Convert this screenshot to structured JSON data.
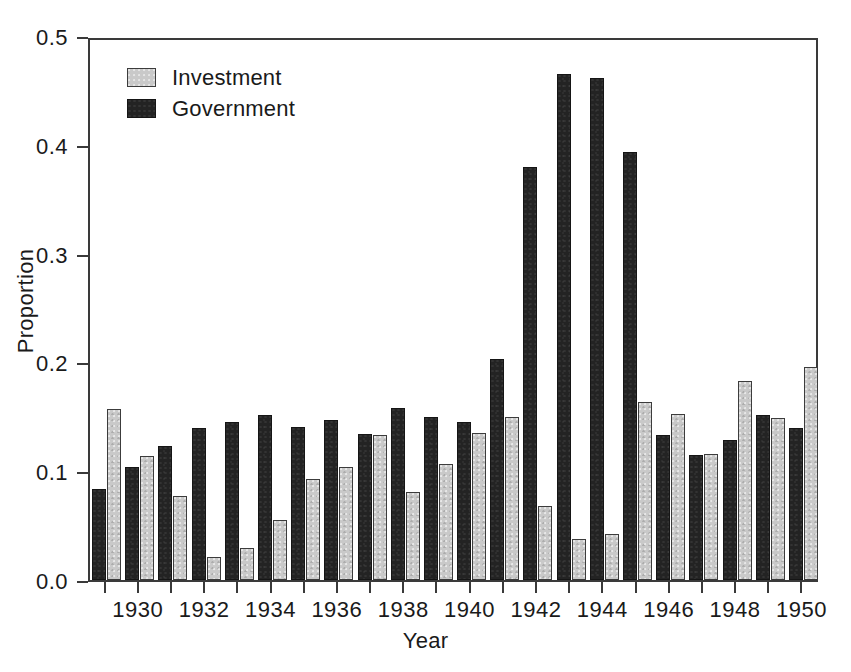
{
  "chart_data": {
    "type": "bar",
    "title": "",
    "xlabel": "Year",
    "ylabel": "Proportion",
    "ylim": [
      0.0,
      0.5
    ],
    "ytick_labels": [
      "0.0",
      "0.1",
      "0.2",
      "0.3",
      "0.4",
      "0.5"
    ],
    "ytick_values": [
      0.0,
      0.1,
      0.2,
      0.3,
      0.4,
      0.5
    ],
    "grid": false,
    "legend_position": "top-left",
    "categories": [
      1929,
      1930,
      1931,
      1932,
      1933,
      1934,
      1935,
      1936,
      1937,
      1938,
      1939,
      1940,
      1941,
      1942,
      1943,
      1944,
      1945,
      1946,
      1947,
      1948,
      1949,
      1950
    ],
    "xtick_labels": [
      "",
      "1930",
      "",
      "1932",
      "",
      "1934",
      "",
      "1936",
      "",
      "1938",
      "",
      "1940",
      "",
      "1942",
      "",
      "1944",
      "",
      "1946",
      "",
      "1948",
      "",
      "1950"
    ],
    "series": [
      {
        "name": "Government",
        "color": "#232323",
        "values": [
          0.084,
          0.104,
          0.123,
          0.14,
          0.145,
          0.152,
          0.141,
          0.147,
          0.134,
          0.158,
          0.15,
          0.145,
          0.203,
          0.38,
          0.465,
          0.461,
          0.393,
          0.133,
          0.115,
          0.129,
          0.152,
          0.14
        ]
      },
      {
        "name": "Investment",
        "color": "#c9c9c9",
        "values": [
          0.157,
          0.114,
          0.077,
          0.021,
          0.029,
          0.055,
          0.093,
          0.104,
          0.133,
          0.081,
          0.107,
          0.135,
          0.15,
          0.068,
          0.038,
          0.042,
          0.164,
          0.153,
          0.116,
          0.183,
          0.149,
          0.196
        ]
      }
    ]
  },
  "legend": {
    "items": [
      {
        "label": "Investment",
        "swatch": "inv"
      },
      {
        "label": "Government",
        "swatch": "gov"
      }
    ]
  },
  "axes": {
    "y_title": "Proportion",
    "x_title": "Year"
  }
}
